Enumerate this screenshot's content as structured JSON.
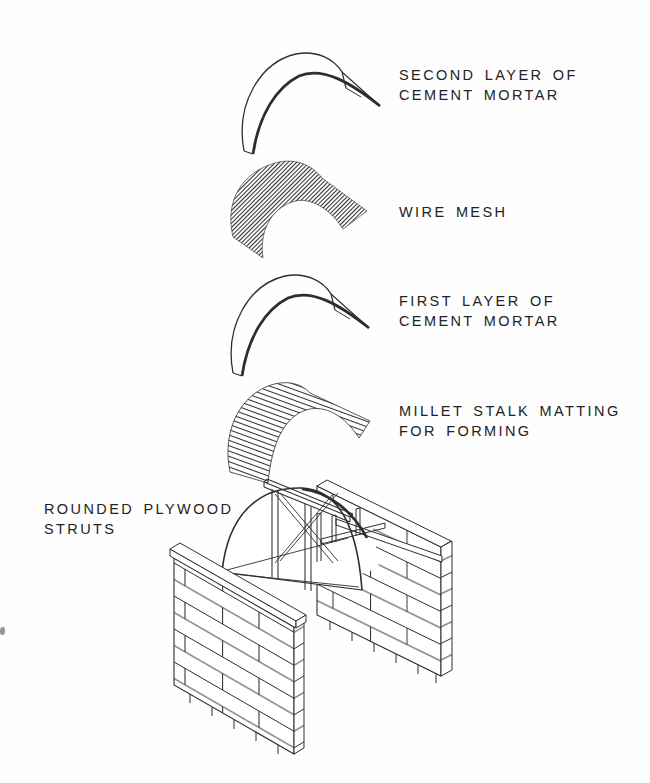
{
  "page": {
    "background": "#fefefe",
    "ink": "#2e2e2e"
  },
  "figure": {
    "labels": [
      {
        "id": "second-cement-mortar",
        "lines": [
          "SECOND LAYER OF",
          "CEMENT MORTAR"
        ]
      },
      {
        "id": "wire-mesh",
        "lines": [
          "WIRE MESH"
        ]
      },
      {
        "id": "first-cement-mortar",
        "lines": [
          "FIRST LAYER OF",
          "CEMENT MORTAR"
        ]
      },
      {
        "id": "millet-stalk-matting",
        "lines": [
          "MILLET STALK MATTING",
          "FOR FORMING"
        ]
      },
      {
        "id": "rounded-plywood-struts",
        "lines": [
          "ROUNDED PLYWOOD",
          "STRUTS"
        ]
      }
    ]
  }
}
